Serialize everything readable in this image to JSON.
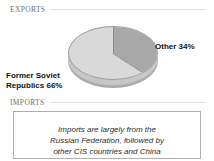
{
  "sections": {
    "exports": {
      "label": "EXPORTS"
    },
    "imports": {
      "label": "IMPORTS"
    }
  },
  "chart_data": {
    "type": "pie",
    "title": "EXPORTS",
    "categories": [
      "Former Soviet Republics",
      "Other"
    ],
    "values": [
      66,
      34
    ],
    "value_labels": [
      "Former Soviet Republics 66%",
      "Other 34%"
    ],
    "units": "percent",
    "legend": "none",
    "annotations": [],
    "style": {
      "three_d": true,
      "slice_colors": [
        "#d9d9d9",
        "#a8a8a8"
      ],
      "start_angle_deg": 0,
      "direction": "clockwise"
    }
  },
  "labels": {
    "former_soviet": "Former Soviet\nRepublics 66%",
    "other": "Other 34%"
  },
  "imports_note": {
    "line1": "Imports are largely from the",
    "line2": "Russian Federation, followed by",
    "line3": "other CIS countries and China"
  },
  "colors": {
    "page_background": "#ffffff",
    "header_text": "#6f6f6f",
    "header_rule": "#dedede",
    "slice_major": "#d9d9d9",
    "slice_minor": "#a8a8a8",
    "pie_side": "#b9b9b9",
    "box_border": "#b0b0b0",
    "label_text": "#111111"
  }
}
